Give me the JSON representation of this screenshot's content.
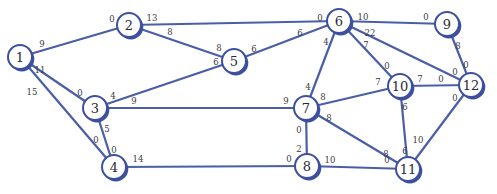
{
  "diagram": {
    "type": "flow-network",
    "colors": {
      "edge": "#4a5ea8",
      "node_border": "#3d50a0",
      "node_fill": "#ffffff",
      "text": "#2a2a35"
    },
    "nodes": [
      {
        "id": "1",
        "label": "1",
        "x": 20,
        "y": 57
      },
      {
        "id": "2",
        "label": "2",
        "x": 129,
        "y": 25
      },
      {
        "id": "3",
        "label": "3",
        "x": 95,
        "y": 108
      },
      {
        "id": "4",
        "label": "4",
        "x": 114,
        "y": 167
      },
      {
        "id": "5",
        "label": "5",
        "x": 234,
        "y": 61
      },
      {
        "id": "6",
        "label": "6",
        "x": 339,
        "y": 21
      },
      {
        "id": "7",
        "label": "7",
        "x": 306,
        "y": 108
      },
      {
        "id": "8",
        "label": "8",
        "x": 307,
        "y": 166
      },
      {
        "id": "9",
        "label": "9",
        "x": 447,
        "y": 24
      },
      {
        "id": "10",
        "label": "10",
        "x": 400,
        "y": 86
      },
      {
        "id": "11",
        "label": "11",
        "x": 408,
        "y": 169
      },
      {
        "id": "12",
        "label": "12",
        "x": 471,
        "y": 85
      }
    ],
    "edges": [
      {
        "from": "1",
        "to": "2",
        "label_from": "9",
        "label_to": "0",
        "lf": [
          42,
          44
        ],
        "lt": [
          112,
          19
        ]
      },
      {
        "from": "1",
        "to": "3",
        "label_from": "11",
        "label_to": "0",
        "lf": [
          40,
          70
        ],
        "lt": [
          80,
          93
        ]
      },
      {
        "from": "1",
        "to": "4",
        "label_from": "15",
        "label_to": "0",
        "lf": [
          32,
          92
        ],
        "lt": [
          96,
          140
        ]
      },
      {
        "from": "2",
        "to": "6",
        "label_from": "13",
        "label_to": "0",
        "lf": [
          152,
          18
        ],
        "lt": [
          320,
          18
        ]
      },
      {
        "from": "2",
        "to": "5",
        "label_from": "8",
        "label_to": "8",
        "lf": [
          170,
          32
        ],
        "lt": [
          219,
          48
        ]
      },
      {
        "from": "3",
        "to": "5",
        "label_from": "4",
        "label_to": "6",
        "lf": [
          113,
          96
        ],
        "lt": [
          216,
          62
        ]
      },
      {
        "from": "3",
        "to": "7",
        "label_from": "9",
        "label_to": "9",
        "lf": [
          134,
          101
        ],
        "lt": [
          286,
          101
        ]
      },
      {
        "from": "3",
        "to": "4",
        "label_from": "5",
        "label_to": "0",
        "lf": [
          107,
          129
        ],
        "lt": [
          114,
          150
        ]
      },
      {
        "from": "5",
        "to": "6",
        "label_from": "6",
        "label_to": "6",
        "lf": [
          254,
          49
        ],
        "lt": [
          300,
          33
        ]
      },
      {
        "from": "4",
        "to": "8",
        "label_from": "14",
        "label_to": "0",
        "lf": [
          138,
          159
        ],
        "lt": [
          289,
          159
        ]
      },
      {
        "from": "6",
        "to": "9",
        "label_from": "10",
        "label_to": "0",
        "lf": [
          363,
          17
        ],
        "lt": [
          426,
          17
        ]
      },
      {
        "from": "6",
        "to": "7",
        "label_from": "4",
        "label_to": "4",
        "lf": [
          326,
          42
        ],
        "lt": [
          308,
          87
        ]
      },
      {
        "from": "6",
        "to": "10",
        "label_from": "7",
        "label_to": "0",
        "lf": [
          366,
          45
        ],
        "lt": [
          387,
          66
        ]
      },
      {
        "from": "6",
        "to": "12",
        "label_from": "22",
        "label_to": "0",
        "lf": [
          370,
          33
        ],
        "lt": [
          455,
          72
        ]
      },
      {
        "from": "7",
        "to": "10",
        "label_from": "8",
        "label_to": "7",
        "lf": [
          323,
          97
        ],
        "lt": [
          378,
          82
        ]
      },
      {
        "from": "7",
        "to": "8",
        "label_from": "0",
        "label_to": "2",
        "lf": [
          299,
          130
        ],
        "lt": [
          299,
          149
        ]
      },
      {
        "from": "7",
        "to": "11",
        "label_from": "8",
        "label_to": "8",
        "lf": [
          329,
          118
        ],
        "lt": [
          386,
          154
        ]
      },
      {
        "from": "8",
        "to": "11",
        "label_from": "10",
        "label_to": "0",
        "lf": [
          330,
          160
        ],
        "lt": [
          387,
          160
        ]
      },
      {
        "from": "9",
        "to": "12",
        "label_from": "8",
        "label_to": "0",
        "lf": [
          458,
          46
        ],
        "lt": [
          466,
          65
        ]
      },
      {
        "from": "10",
        "to": "12",
        "label_from": "7",
        "label_to": "0",
        "lf": [
          420,
          79
        ],
        "lt": [
          441,
          79
        ]
      },
      {
        "from": "10",
        "to": "11",
        "label_from": "6",
        "label_to": "6",
        "lf": [
          405,
          107
        ],
        "lt": [
          405,
          151
        ]
      },
      {
        "from": "12",
        "to": "11",
        "label_from": "0",
        "label_to": "10",
        "lf": [
          455,
          98
        ],
        "lt": [
          418,
          140
        ]
      }
    ]
  }
}
